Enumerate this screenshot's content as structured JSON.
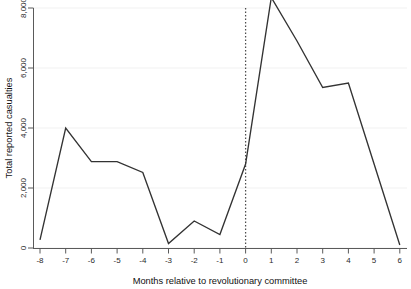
{
  "chart_data": {
    "type": "line",
    "title": "",
    "subtitle": "",
    "xlabel": "Months relative to revolutionary committee",
    "ylabel": "Total reported casualties",
    "x": [
      -8,
      -7,
      -6,
      -5,
      -4,
      -3,
      -2,
      -1,
      0,
      1,
      2,
      3,
      4,
      5,
      6
    ],
    "values": [
      270,
      4000,
      2880,
      2880,
      2520,
      150,
      900,
      450,
      2800,
      8350,
      6900,
      5350,
      5500,
      2800,
      100
    ],
    "series": [
      {
        "name": "Total reported casualties",
        "values": [
          270,
          4000,
          2880,
          2880,
          2520,
          150,
          900,
          450,
          2800,
          8350,
          6900,
          5350,
          5500,
          2800,
          100
        ]
      }
    ],
    "xtick_labels": [
      "-8",
      "-7",
      "-6",
      "-5",
      "-4",
      "-3",
      "-2",
      "-1",
      "0",
      "1",
      "2",
      "3",
      "4",
      "5",
      "6"
    ],
    "ytick_values": [
      0,
      2000,
      4000,
      6000,
      8000
    ],
    "ytick_labels": [
      "0",
      "2,000",
      "4,000",
      "6,000",
      "8,000"
    ],
    "xlim": [
      -8,
      6
    ],
    "ylim": [
      0,
      8600
    ],
    "grid": "horizontal",
    "legend": "none",
    "annotations": [
      {
        "name": "event-reference-line",
        "type": "vertical-dashed-line",
        "x": 0,
        "label": ""
      }
    ],
    "colors": {
      "line": "#333333",
      "grid": "#f2f2f2",
      "axis": "#5a5a5a",
      "event_line": "#4d4d4d",
      "background": "#ffffff"
    }
  }
}
